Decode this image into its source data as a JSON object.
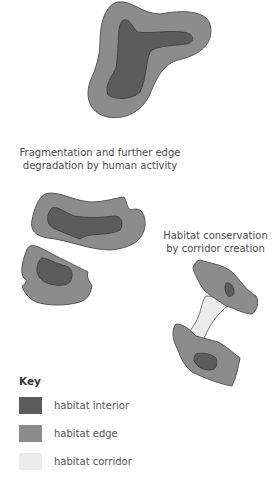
{
  "diagram": {
    "top_shape": {
      "name": "original habitat"
    },
    "captions": {
      "fragmentation": "Fragmentation and further edge degradation by human activity",
      "conservation": "Habitat conservation by corridor creation"
    },
    "key": {
      "title": "Key",
      "items": [
        {
          "label": "habitat interior",
          "color": "#5c5c5c"
        },
        {
          "label": "habitat edge",
          "color": "#8c8c8c"
        },
        {
          "label": "habitat corridor",
          "color": "#ebebeb"
        }
      ]
    },
    "colors": {
      "interior": "#5c5c5c",
      "edge": "#8c8c8c",
      "corridor": "#ebebeb",
      "outline": "#555555"
    }
  }
}
